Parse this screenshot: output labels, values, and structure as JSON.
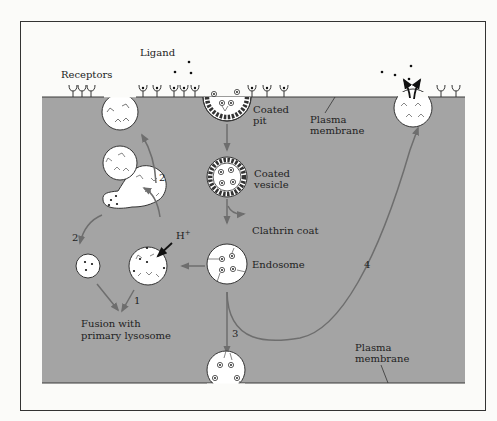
{
  "diagram": {
    "type": "receptor-mediated endocytosis pathway",
    "colors": {
      "background": "#fbfbf9",
      "cytoplasm": "#a4a4a4",
      "membrane_line": "#3a3a3a",
      "arrow": "#6e6e6e",
      "vesicle_fill": "#ffffff",
      "frame": "#333333"
    },
    "labels": {
      "ligand": "Ligand",
      "receptors": "Receptors",
      "coated_pit": [
        "Coated",
        "pit"
      ],
      "plasma_membrane_top": [
        "Plasma",
        "membrane"
      ],
      "coated_vesicle": [
        "Coated",
        "vesicle"
      ],
      "clathrin_coat": "Clathrin coat",
      "endosome": "Endosome",
      "proton": "H",
      "proton_sup": "+",
      "fusion": [
        "Fusion with",
        "primary lysosome"
      ],
      "plasma_membrane_bottom": [
        "Plasma",
        "membrane"
      ]
    },
    "pathway_numbers": {
      "path1": "1",
      "path2_upper": "2",
      "path2_lower": "2",
      "path3": "3",
      "path4": "4"
    }
  }
}
